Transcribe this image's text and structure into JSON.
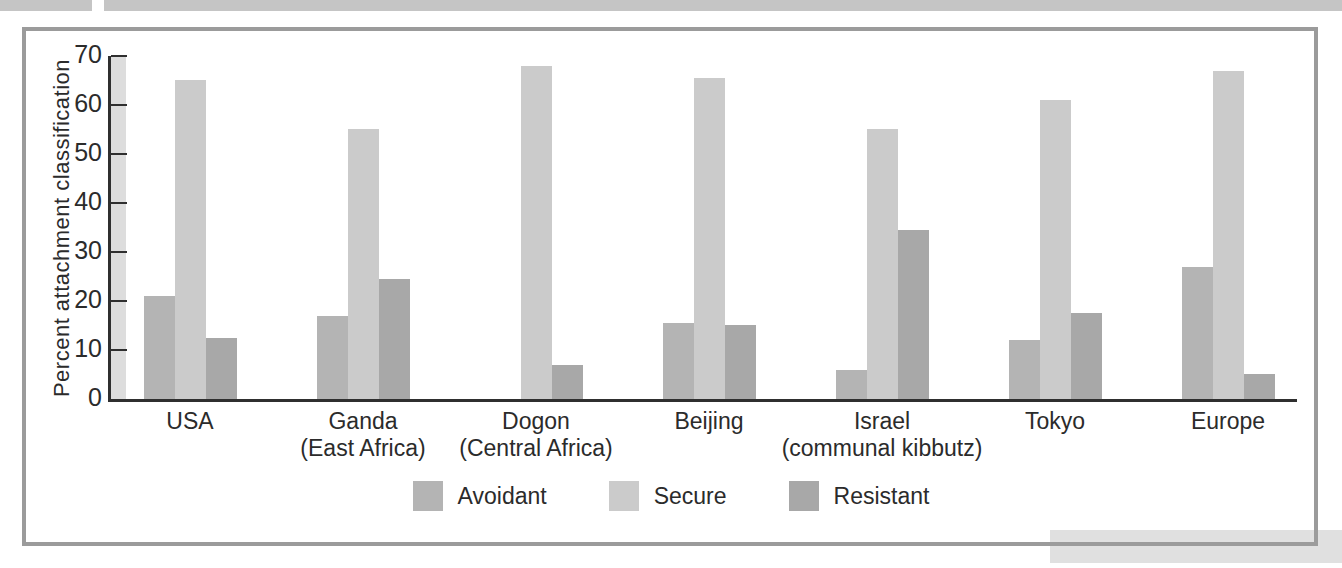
{
  "page": {
    "top_strip_color": "#c5c5c5",
    "panel_border_color": "#9b9b9b",
    "corner_band_color": "#e0e0e0",
    "axis_band_color": "#dddddd",
    "axis_color": "#2f2f2f",
    "text_color": "#2b2b2b"
  },
  "chart_data": {
    "type": "bar",
    "title": "",
    "xlabel": "",
    "ylabel": "Percent attachment classification",
    "ylim": [
      0,
      70
    ],
    "yticks": [
      0,
      10,
      20,
      30,
      40,
      50,
      60,
      70
    ],
    "grid": false,
    "legend_position": "bottom",
    "categories": [
      {
        "label": "USA",
        "sublabel": ""
      },
      {
        "label": "Ganda",
        "sublabel": "(East Africa)"
      },
      {
        "label": "Dogon",
        "sublabel": "(Central Africa)"
      },
      {
        "label": "Beijing",
        "sublabel": ""
      },
      {
        "label": "Israel",
        "sublabel": "(communal kibbutz)"
      },
      {
        "label": "Tokyo",
        "sublabel": ""
      },
      {
        "label": "Europe",
        "sublabel": ""
      }
    ],
    "series": [
      {
        "name": "Avoidant",
        "color": "#b4b4b4",
        "values": [
          21,
          17,
          0,
          15.5,
          6,
          12,
          27
        ]
      },
      {
        "name": "Secure",
        "color": "#cbcbcb",
        "values": [
          65,
          55,
          68,
          65.5,
          55,
          61,
          67
        ]
      },
      {
        "name": "Resistant",
        "color": "#a8a8a8",
        "values": [
          12.5,
          24.5,
          7,
          15,
          34.5,
          17.5,
          5
        ]
      }
    ]
  }
}
